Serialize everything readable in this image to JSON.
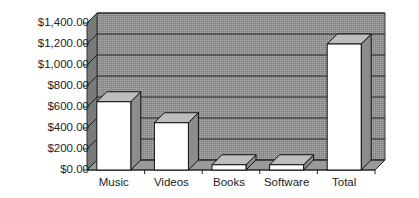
{
  "chart_data": {
    "type": "bar",
    "title": "",
    "xlabel": "",
    "ylabel": "",
    "categories": [
      "Music",
      "Videos",
      "Books",
      "Software",
      "Total"
    ],
    "values": [
      650,
      450,
      50,
      50,
      1200
    ],
    "ylim": [
      0,
      1400
    ],
    "yticks": [
      "$0.00",
      "$200.00",
      "$400.00",
      "$600.00",
      "$800.00",
      "$1,000.00",
      "$1,200.00",
      "$1,400.00"
    ],
    "grid": true,
    "legend": null,
    "style": "3d",
    "colors": {
      "bar_face": "#ffffff",
      "bar_top": "#bdbdbd",
      "bar_side": "#8c8c8c",
      "wall": "#8a8a8a",
      "floor": "#9a9a9a"
    }
  }
}
